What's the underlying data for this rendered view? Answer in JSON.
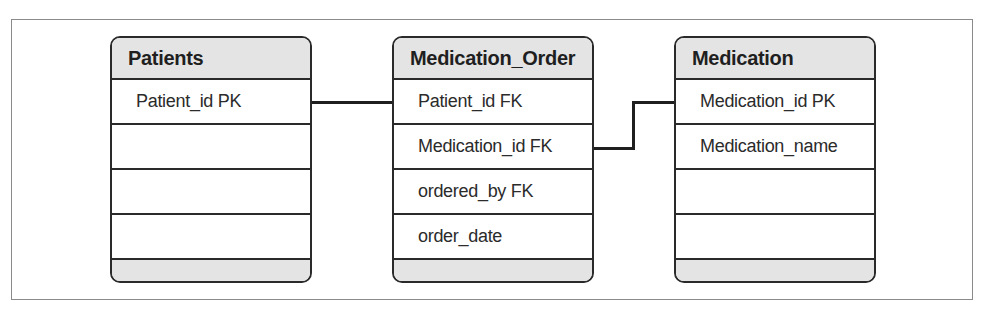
{
  "diagram": {
    "type": "entity-relationship",
    "entities": [
      {
        "name": "Patients",
        "fields": [
          "Patient_id PK",
          "",
          "",
          ""
        ]
      },
      {
        "name": "Medication_Order",
        "fields": [
          "Patient_id FK",
          "Medication_id FK",
          "ordered_by FK",
          "order_date"
        ]
      },
      {
        "name": "Medication",
        "fields": [
          "Medication_id PK",
          "Medication_name",
          "",
          ""
        ]
      }
    ],
    "relationships": [
      {
        "from": "Patients.Patient_id PK",
        "to": "Medication_Order.Patient_id FK"
      },
      {
        "from": "Medication_Order.Medication_id FK",
        "to": "Medication.Medication_id PK"
      }
    ],
    "colors": {
      "header_fill": "#e4e4e4",
      "border": "#2a2a2a",
      "frame": "#8a8a8a"
    }
  }
}
